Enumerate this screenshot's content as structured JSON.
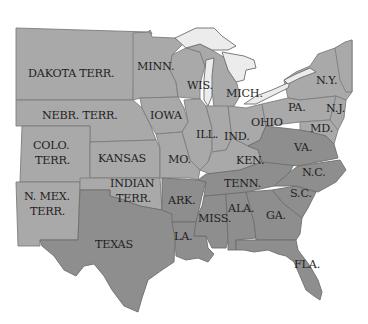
{
  "map": {
    "subject": "United States during the Civil War era",
    "colors": {
      "background": "#ffffff",
      "union_states": "#a9a9a9",
      "confederate_states": "#8e8e8e",
      "lakes": "#ececec",
      "borders": "#7d7d7d",
      "label_text": "#1f1f1f"
    },
    "labels": {
      "dakota": "DAKOTA TERR.",
      "minn": "MINN.",
      "wis": "WIS.",
      "mich": "MICH.",
      "ny": "N.Y.",
      "nebr": "NEBR. TERR.",
      "iowa": "IOWA",
      "pa": "PA.",
      "nj": "N.J.",
      "ohio": "OHIO",
      "colo_1": "COLO.",
      "colo_2": "TERR.",
      "ill": "ILL.",
      "ind": "IND.",
      "md": "MD.",
      "kansas": "KANSAS",
      "mo": "MO.",
      "ken": "KEN.",
      "va": "VA.",
      "nmex_1": "N. MEX.",
      "nmex_2": "TERR.",
      "indian_1": "INDIAN",
      "indian_2": "TERR.",
      "tenn": "TENN.",
      "nc": "N.C.",
      "ark": "ARK.",
      "sc": "S.C.",
      "ala": "ALA.",
      "miss": "MISS.",
      "ga": "GA.",
      "texas": "TEXAS",
      "la": "LA.",
      "fla": "FLA."
    }
  }
}
